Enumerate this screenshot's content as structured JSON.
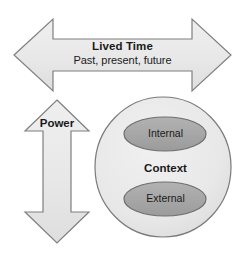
{
  "diagram": {
    "type": "conceptual-diagram",
    "background_color": "#ffffff",
    "shape_fill": "#e9e9e9",
    "shape_stroke": "#7f7f7f",
    "ellipse_fill": "#a6a6a6",
    "ellipse_stroke": "#6e6e6e",
    "text_color": "#1a1a1a",
    "elements": {
      "lived_time_arrow": {
        "shape": "double-headed-horizontal-arrow",
        "title": "Lived Time",
        "subtitle": "Past, present, future"
      },
      "power_arrow": {
        "shape": "double-headed-vertical-arrow",
        "title": "Power"
      },
      "context_circle": {
        "shape": "circle",
        "title": "Context",
        "inner_ellipses": [
          {
            "label": "Internal",
            "position": "top"
          },
          {
            "label": "External",
            "position": "bottom"
          }
        ]
      }
    }
  }
}
